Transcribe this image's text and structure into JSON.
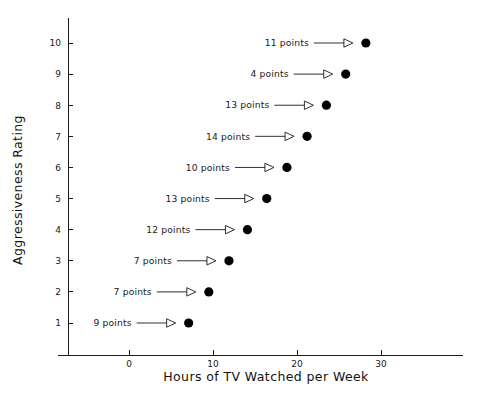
{
  "chart_data": {
    "type": "scatter",
    "title": "",
    "xlabel": "Hours of TV Watched per Week",
    "ylabel": "Aggressiveness Rating",
    "xlim": [
      -8,
      39
    ],
    "ylim": [
      0,
      11.3
    ],
    "xticks": [
      0,
      10,
      20,
      30
    ],
    "xtick_labels": [
      "0",
      "10",
      "20",
      "30"
    ],
    "yticks": [
      1,
      2,
      3,
      4,
      5,
      6,
      7,
      8,
      9,
      10
    ],
    "ytick_labels": [
      "1",
      "2",
      "3",
      "4",
      "5",
      "6",
      "7",
      "8",
      "9",
      "10"
    ],
    "grid": false,
    "legend": false,
    "marker": "filled-circle",
    "marker_color": "#000000",
    "points": [
      {
        "y": 10,
        "x": 28.2,
        "label": "11 points",
        "count": 11
      },
      {
        "y": 9,
        "x": 25.8,
        "label": "4 points",
        "count": 4
      },
      {
        "y": 8,
        "x": 23.5,
        "label": "13 points",
        "count": 13
      },
      {
        "y": 7,
        "x": 21.2,
        "label": "14 points",
        "count": 14
      },
      {
        "y": 6,
        "x": 18.8,
        "label": "10 points",
        "count": 10
      },
      {
        "y": 5,
        "x": 16.4,
        "label": "13 points",
        "count": 13
      },
      {
        "y": 4,
        "x": 14.1,
        "label": "12 points",
        "count": 12
      },
      {
        "y": 3,
        "x": 11.9,
        "label": "7 points",
        "count": 7
      },
      {
        "y": 2,
        "x": 9.5,
        "label": "7 points",
        "count": 7
      },
      {
        "y": 1,
        "x": 7.1,
        "label": "9 points",
        "count": 9
      }
    ],
    "annotations": [
      "11 points",
      "4 points",
      "13 points",
      "14 points",
      "10 points",
      "13 points",
      "12 points",
      "7 points",
      "7 points",
      "9 points"
    ],
    "annotation_style": "text with hollow-arrowhead leader line pointing right to the marker"
  }
}
